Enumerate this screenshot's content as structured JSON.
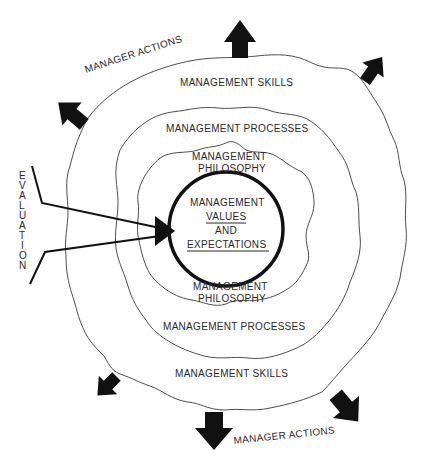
{
  "diagram": {
    "type": "concentric-layers",
    "layers": [
      {
        "id": "core",
        "lines": [
          "MANAGEMENT",
          "VALUES",
          "AND",
          "EXPECTATIONS"
        ],
        "underlined": [
          "VALUES",
          "EXPECTATIONS"
        ]
      },
      {
        "id": "philosophy",
        "top_label": [
          "MANAGEMENT",
          "PHILOSOPHY"
        ],
        "bottom_label": [
          "MANAGEMENT",
          "PHILOSOPHY"
        ]
      },
      {
        "id": "processes",
        "top_label": "MANAGEMENT PROCESSES",
        "bottom_label": "MANAGEMENT PROCESSES"
      },
      {
        "id": "skills",
        "top_label": "MANAGEMENT SKILLS",
        "bottom_label": "MANAGEMENT SKILLS"
      }
    ],
    "outer_label_top": "MANAGER ACTIONS",
    "outer_label_bottom": "MANAGER ACTIONS",
    "feedback_label": "EVALUATION",
    "feedback_letters": [
      "E",
      "V",
      "A",
      "L",
      "U",
      "A",
      "T",
      "I",
      "O",
      "N"
    ],
    "outward_arrows": 6,
    "colors": {
      "ink": "#111111",
      "line": "#3a3a3a",
      "background": "#ffffff"
    }
  }
}
